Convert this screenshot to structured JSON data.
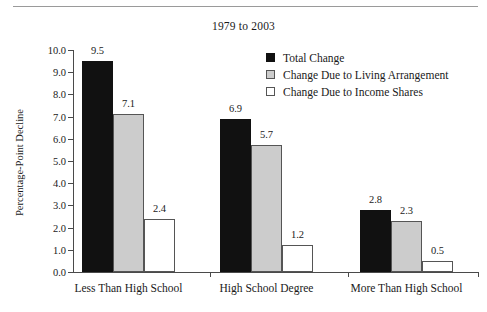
{
  "chart_data": {
    "type": "bar",
    "title": "1979 to 2003",
    "xlabel": "",
    "ylabel": "Percentage-Point Decline",
    "ylim": [
      0.0,
      10.0
    ],
    "ytick_step": 1.0,
    "ytick_labels": [
      "0.0",
      "1.0",
      "2.0",
      "3.0",
      "4.0",
      "5.0",
      "6.0",
      "7.0",
      "8.0",
      "9.0",
      "10.0"
    ],
    "grid": false,
    "legend_position": "upper-right-inside",
    "categories": [
      "Less Than High School",
      "High School Degree",
      "More Than High School"
    ],
    "series": [
      {
        "name": "Total Change",
        "color": "#111111",
        "values": [
          9.5,
          6.9,
          2.8
        ],
        "labels": [
          "9.5",
          "6.9",
          "2.8"
        ]
      },
      {
        "name": "Change Due to Living Arrangement",
        "color": "#cccccc",
        "values": [
          7.1,
          5.7,
          2.3
        ],
        "labels": [
          "7.1",
          "5.7",
          "2.3"
        ]
      },
      {
        "name": "Change Due to Income Shares",
        "color": "#ffffff",
        "values": [
          2.4,
          1.2,
          0.5
        ],
        "labels": [
          "2.4",
          "1.2",
          "0.5"
        ]
      }
    ]
  },
  "colors": {
    "axis": "#4a4a4a",
    "rule": "#9a9a9a",
    "text": "#1a1a1a",
    "series_total_change": "#111111",
    "series_living_arrangement": "#cccccc",
    "series_income_shares": "#ffffff"
  }
}
